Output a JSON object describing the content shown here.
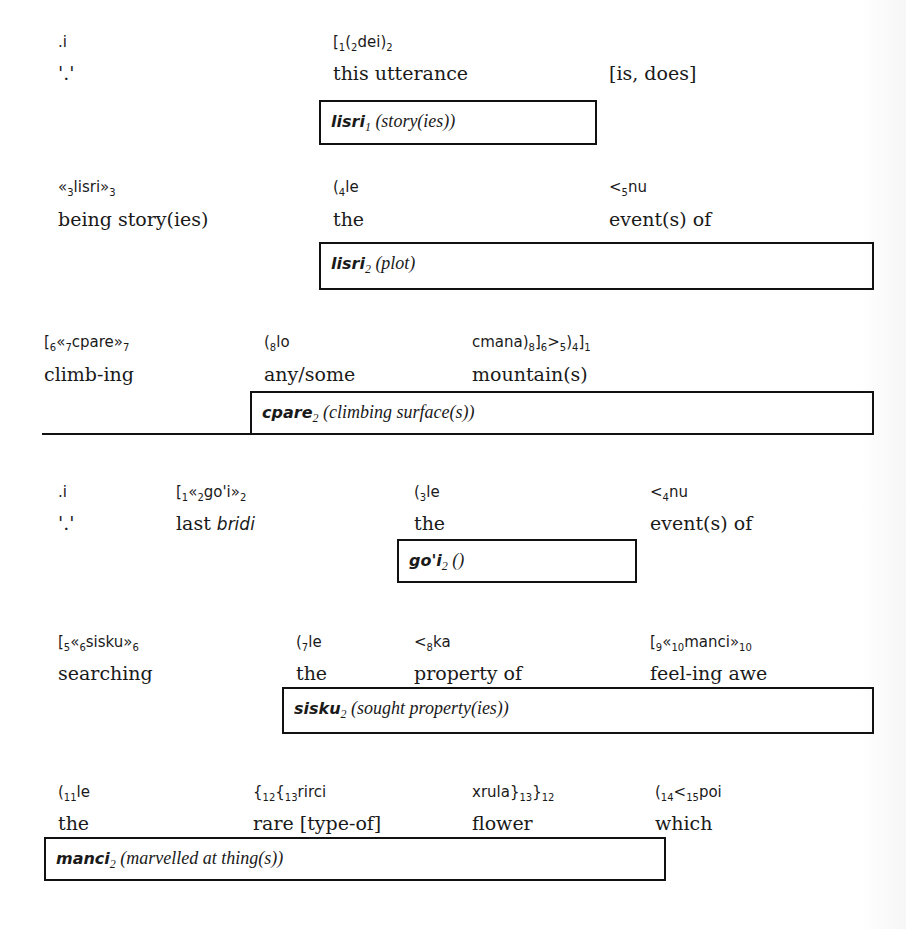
{
  "blocks": [
    {
      "id": 1,
      "tokens": [
        {
          "lojban": ".i",
          "gloss": "'.'"
        },
        {
          "lojban_parts": [
            "[",
            "1",
            "(",
            "2",
            "dei)",
            "2",
            ""
          ],
          "gloss": "this utterance"
        },
        {
          "gloss": "[is, does]"
        }
      ],
      "place_box": {
        "word": "lisri",
        "place": "1",
        "desc": "(story(ies))"
      }
    },
    {
      "id": 2,
      "tokens": [
        {
          "lojban_parts": [
            "«",
            "3",
            "lisri»",
            "3",
            ""
          ],
          "gloss": "being story(ies)"
        },
        {
          "lojban_parts": [
            "(",
            "4",
            "le"
          ],
          "gloss": "the"
        },
        {
          "lojban_parts": [
            "<",
            "5",
            "nu"
          ],
          "gloss": "event(s) of"
        }
      ],
      "place_box": {
        "word": "lisri",
        "place": "2",
        "desc": "(plot)"
      }
    },
    {
      "id": 3,
      "tokens": [
        {
          "lojban_parts": [
            "[",
            "6",
            "«",
            "7",
            "cpare»",
            "7",
            ""
          ],
          "gloss": "climb-ing"
        },
        {
          "lojban_parts": [
            "(",
            "8",
            "lo"
          ],
          "gloss": "any/some"
        },
        {
          "lojban_parts": [
            "cmana)",
            "8",
            "]",
            "6",
            ">",
            "5",
            ")",
            "4",
            "]",
            "1",
            ""
          ],
          "gloss": "mountain(s)"
        }
      ],
      "place_box": {
        "word": "cpare",
        "place": "2",
        "desc": "(climbing surface(s))"
      }
    },
    {
      "id": 4,
      "tokens": [
        {
          "lojban": ".i",
          "gloss": "'.'"
        },
        {
          "lojban_parts": [
            "[",
            "1",
            "«",
            "2",
            "go'i»",
            "2",
            ""
          ],
          "gloss_plain": "last ",
          "gloss_italic": "bridi"
        },
        {
          "lojban_parts": [
            "(",
            "3",
            "le"
          ],
          "gloss": "the"
        },
        {
          "lojban_parts": [
            "<",
            "4",
            "nu"
          ],
          "gloss": "event(s) of"
        }
      ],
      "place_box": {
        "word": "go'i",
        "place": "2",
        "desc": "()"
      }
    },
    {
      "id": 5,
      "tokens": [
        {
          "lojban_parts": [
            "[",
            "5",
            "«",
            "6",
            "sisku»",
            "6",
            ""
          ],
          "gloss": "searching"
        },
        {
          "lojban_parts": [
            "(",
            "7",
            "le"
          ],
          "gloss": "the"
        },
        {
          "lojban_parts": [
            "<",
            "8",
            "ka"
          ],
          "gloss": "property of"
        },
        {
          "lojban_parts": [
            "[",
            "9",
            "«",
            "10",
            "manci»",
            "10",
            ""
          ],
          "gloss": "feel-ing awe"
        }
      ],
      "place_box": {
        "word": "sisku",
        "place": "2",
        "desc": "(sought property(ies))"
      }
    },
    {
      "id": 6,
      "tokens": [
        {
          "lojban_parts": [
            "(",
            "11",
            "le"
          ],
          "gloss": "the"
        },
        {
          "lojban_parts": [
            "{",
            "12",
            "{",
            "13",
            "rirci"
          ],
          "gloss": "rare [type-of]"
        },
        {
          "lojban_parts": [
            "xrula}",
            "13",
            "}",
            "12",
            ""
          ],
          "gloss": "flower"
        },
        {
          "lojban_parts": [
            "(",
            "14",
            "<",
            "15",
            "poi"
          ],
          "gloss": "which"
        }
      ],
      "place_box": {
        "word": "manci",
        "place": "2",
        "desc": "(marvelled at thing(s))"
      }
    }
  ]
}
